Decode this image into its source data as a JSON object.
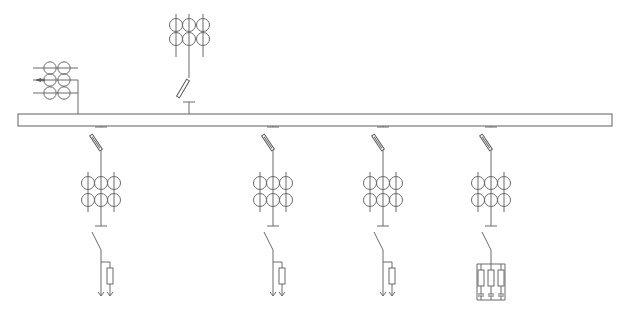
{
  "diagram": {
    "colors": {
      "line": "#6a6a6a",
      "background": "#ffffff"
    },
    "busbar": {
      "x1": 18,
      "x2": 612,
      "y_top": 114,
      "y_bottom": 126
    },
    "incoming_top": {
      "label": "incoming-cabinet",
      "ct_columns_x": [
        176,
        189,
        203
      ],
      "ct_rows_y": [
        25,
        39
      ],
      "ct_line_y": [
        14,
        57
      ],
      "center_x": 189,
      "switch": {
        "x1": 178,
        "y1": 97,
        "x2": 188,
        "y2": 80
      },
      "t_y": 102
    },
    "pt_left": {
      "label": "potential-transformer",
      "rows_y": [
        68,
        80,
        93
      ],
      "line_x": [
        33,
        78
      ],
      "circles_x": [
        50,
        64
      ],
      "drop_x": 78,
      "arrow_row": 1
    },
    "feeders": [
      {
        "id": "feeder-1",
        "x": 101,
        "load": "single"
      },
      {
        "id": "feeder-2",
        "x": 273,
        "load": "single"
      },
      {
        "id": "feeder-3",
        "x": 383,
        "load": "single"
      },
      {
        "id": "feeder-4",
        "x": 491,
        "load": "triple"
      }
    ],
    "feeder_geometry": {
      "t_y": 127,
      "disconnector": {
        "top_y": 130,
        "bottom_y": 150,
        "dx": -10
      },
      "ct_rows_y": [
        183,
        200
      ],
      "ct_col_dx": 13,
      "ct_line_y": [
        172,
        212
      ],
      "earth_t_y": 226,
      "breaker": {
        "top_y": 232,
        "bottom_y": 250,
        "dx": -9
      },
      "branch_y": 262,
      "resistor": {
        "top_y": 268,
        "height": 16,
        "width": 6,
        "dx": 9
      },
      "arrow_y": 296
    }
  }
}
